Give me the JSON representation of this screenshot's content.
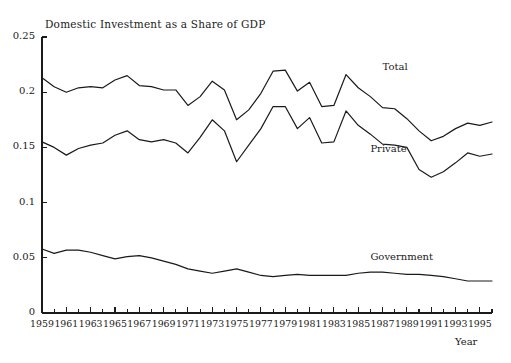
{
  "chart_data": {
    "type": "line",
    "title": "Domestic Investment as a Share of GDP",
    "xlabel": "Year",
    "ylabel": "",
    "xlim": [
      1959,
      1996
    ],
    "ylim": [
      0,
      0.25
    ],
    "grid": false,
    "legend_position": "inline-annotations",
    "ytick_labels": [
      "0",
      "0.05",
      "0.1",
      "0.15",
      "0.2",
      "0.25"
    ],
    "ytick_values": [
      0,
      0.05,
      0.1,
      0.15,
      0.2,
      0.25
    ],
    "xtick_labels": [
      "1959",
      "1961",
      "1963",
      "1965",
      "1967",
      "1969",
      "1971",
      "1973",
      "1975",
      "1977",
      "1979",
      "1981",
      "1983",
      "1985",
      "1987",
      "1989",
      "1991",
      "1993",
      "1995"
    ],
    "xtick_values": [
      1959,
      1961,
      1963,
      1965,
      1967,
      1969,
      1971,
      1973,
      1975,
      1977,
      1979,
      1981,
      1983,
      1985,
      1987,
      1989,
      1991,
      1993,
      1995
    ],
    "minor_xticks": [
      1960,
      1962,
      1964,
      1966,
      1968,
      1970,
      1972,
      1974,
      1976,
      1978,
      1980,
      1982,
      1984,
      1986,
      1988,
      1990,
      1992,
      1994,
      1996
    ],
    "x": [
      1959,
      1960,
      1961,
      1962,
      1963,
      1964,
      1965,
      1966,
      1967,
      1968,
      1969,
      1970,
      1971,
      1972,
      1973,
      1974,
      1975,
      1976,
      1977,
      1978,
      1979,
      1980,
      1981,
      1982,
      1983,
      1984,
      1985,
      1986,
      1987,
      1988,
      1989,
      1990,
      1991,
      1992,
      1993,
      1994,
      1995,
      1996
    ],
    "series": [
      {
        "name": "Total",
        "color": "#1a1a1a",
        "label_x": 1987,
        "label_y": 0.222,
        "values": [
          0.213,
          0.205,
          0.2,
          0.204,
          0.205,
          0.204,
          0.211,
          0.215,
          0.206,
          0.205,
          0.202,
          0.202,
          0.188,
          0.196,
          0.21,
          0.202,
          0.175,
          0.184,
          0.199,
          0.219,
          0.22,
          0.201,
          0.209,
          0.187,
          0.188,
          0.216,
          0.204,
          0.196,
          0.186,
          0.185,
          0.176,
          0.165,
          0.156,
          0.16,
          0.167,
          0.172,
          0.17,
          0.173
        ]
      },
      {
        "name": "Private",
        "color": "#1a1a1a",
        "label_x": 1986,
        "label_y": 0.148,
        "values": [
          0.155,
          0.15,
          0.143,
          0.149,
          0.152,
          0.154,
          0.161,
          0.165,
          0.157,
          0.155,
          0.157,
          0.154,
          0.145,
          0.159,
          0.175,
          0.165,
          0.137,
          0.152,
          0.167,
          0.187,
          0.187,
          0.167,
          0.177,
          0.154,
          0.155,
          0.183,
          0.17,
          0.162,
          0.153,
          0.152,
          0.15,
          0.13,
          0.123,
          0.128,
          0.136,
          0.145,
          0.142,
          0.144
        ]
      },
      {
        "name": "Government",
        "color": "#1a1a1a",
        "label_x": 1986,
        "label_y": 0.05,
        "values": [
          0.058,
          0.054,
          0.057,
          0.057,
          0.055,
          0.052,
          0.049,
          0.051,
          0.052,
          0.05,
          0.047,
          0.044,
          0.04,
          0.038,
          0.036,
          0.038,
          0.04,
          0.037,
          0.034,
          0.033,
          0.034,
          0.035,
          0.034,
          0.034,
          0.034,
          0.034,
          0.036,
          0.037,
          0.037,
          0.036,
          0.035,
          0.035,
          0.034,
          0.033,
          0.031,
          0.029,
          0.029,
          0.029
        ]
      }
    ]
  },
  "axes": {
    "y_axis_name": "value-axis",
    "x_axis_name": "year-axis"
  }
}
